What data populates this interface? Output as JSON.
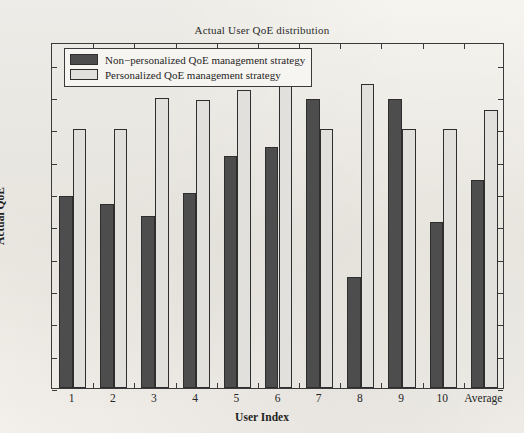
{
  "chart_data": {
    "type": "bar",
    "title": "Actual User QoE distribution",
    "xlabel": "User Index",
    "ylabel": "Actual QoE",
    "categories": [
      "1",
      "2",
      "3",
      "4",
      "5",
      "6",
      "7",
      "8",
      "9",
      "10",
      "Average"
    ],
    "series": [
      {
        "name": "Non−personalized QoE management strategy",
        "color": "#4d4d4d",
        "values": [
          2.97,
          2.85,
          2.66,
          3.02,
          3.58,
          3.72,
          4.47,
          1.72,
          4.47,
          2.56,
          3.22
        ]
      },
      {
        "name": "Personalized QoE management strategy",
        "color": "#e2e0dc",
        "values": [
          4.0,
          4.0,
          4.48,
          4.46,
          4.61,
          4.67,
          4.0,
          4.7,
          4.0,
          4.0,
          4.3
        ]
      }
    ],
    "ylim": [
      0,
      5.35
    ],
    "yticks": [
      0,
      0.5,
      1,
      1.5,
      2,
      2.5,
      3,
      3.5,
      4,
      4.5,
      5
    ],
    "ytick_labels": [
      "0",
      "0.5",
      "1",
      "1.5",
      "2",
      "2.5",
      "3",
      "3.5",
      "4",
      "4.5",
      "5"
    ],
    "grid": false,
    "legend_position": "upper-left"
  },
  "legend": {
    "entries": [
      {
        "label": "Non−personalized QoE management strategy",
        "swatch": "dark-gray"
      },
      {
        "label": "Personalized QoE management strategy",
        "swatch": "light-gray"
      }
    ]
  },
  "colors": {
    "series_0": "#4d4d4d",
    "series_1": "#e2e0dc",
    "axis": "#3a3a3a",
    "background": "#f3f1ec"
  }
}
